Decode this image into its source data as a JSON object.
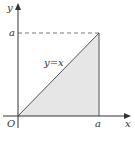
{
  "diagram": {
    "title": "",
    "labels": {
      "y_axis": "y",
      "x_axis": "x",
      "origin": "O",
      "y_tick": "a",
      "x_tick": "a",
      "line": "y=x"
    },
    "colors": {
      "axis": "#333333",
      "fill": "#e6e6e6",
      "line": "#555555",
      "dash": "#555555"
    },
    "shapes": {
      "triangle": "region under y=x from x=0 to x=a",
      "dashed_line": "horizontal dashed line at y=a from y-axis to x=a",
      "vertical_line": "line x=a from 0 to a"
    }
  }
}
